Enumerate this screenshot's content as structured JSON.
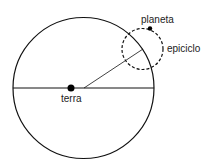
{
  "diagram": {
    "labels": {
      "planet": "planeta",
      "epicycle": "epiciclo",
      "earth": "terra"
    },
    "colors": {
      "stroke": "#111111",
      "background": "#ffffff"
    }
  }
}
